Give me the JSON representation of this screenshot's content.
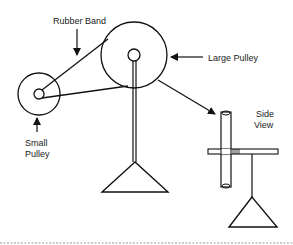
{
  "diagram": {
    "labels": {
      "rubber_band": "Rubber Band",
      "large_pulley": "Large Pulley",
      "small_pulley_line1": "Small",
      "small_pulley_line2": "Pulley",
      "side_view_line1": "Side",
      "side_view_line2": "View"
    },
    "colors": {
      "stroke": "#111111",
      "background": "#ffffff",
      "text": "#222222"
    }
  }
}
